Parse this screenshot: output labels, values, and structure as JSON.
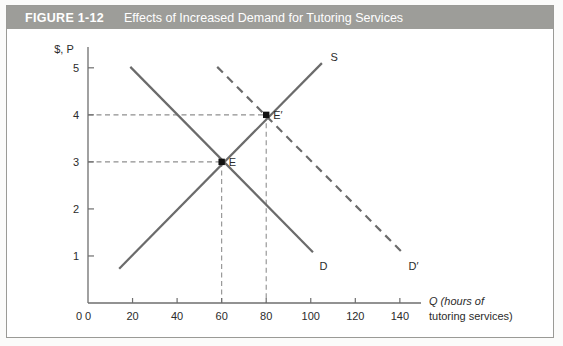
{
  "figure": {
    "number": "FIGURE 1-12",
    "title": "Effects of Increased Demand for Tutoring Services",
    "header_bg": "#9d9d99",
    "header_text_color": "#ffffff"
  },
  "colors": {
    "curve": "#6b6b6b",
    "axis": "#6e6e6e",
    "guide": "#8f8f8f",
    "point": "#111111",
    "frame": "#9a9a96",
    "background": "#ffffff"
  },
  "chart_data": {
    "type": "line",
    "title": "Effects of Increased Demand for Tutoring Services",
    "xlabel_line1": "Q (hours of",
    "xlabel_line2": "tutoring services)",
    "xlabel_italic_symbol": "Q",
    "ylabel": "$, P",
    "ylabel_italic_symbol": "P",
    "xlim": [
      0,
      145
    ],
    "ylim": [
      0,
      5.4
    ],
    "xticks": [
      0,
      20,
      40,
      60,
      80,
      100,
      120,
      140
    ],
    "xtick_labels": [
      "0",
      "20",
      "40",
      "60",
      "80",
      "100",
      "120",
      "140"
    ],
    "yticks": [
      1,
      2,
      3,
      4,
      5
    ],
    "ytick_labels": [
      "1",
      "2",
      "3",
      "4",
      "5"
    ],
    "grid": false,
    "legend": "none",
    "series": [
      {
        "name": "S",
        "label": "S",
        "style": "solid",
        "role": "supply",
        "points": [
          [
            14,
            0.73
          ],
          [
            105,
            5.1
          ]
        ],
        "label_pos": [
          108,
          5.22
        ]
      },
      {
        "name": "D",
        "label": "D",
        "style": "solid",
        "role": "demand-original",
        "points": [
          [
            19,
            5.02
          ],
          [
            101,
            1.08
          ]
        ],
        "label_pos": [
          103,
          0.79
        ]
      },
      {
        "name": "D'",
        "label": "D′",
        "style": "dashed",
        "role": "demand-increased",
        "points": [
          [
            58,
            5.02
          ],
          [
            141,
            1.08
          ]
        ],
        "label_pos": [
          143,
          0.79
        ]
      }
    ],
    "points": [
      {
        "name": "E",
        "label": "E",
        "x": 60,
        "y": 3,
        "label_offset": [
          4,
          0.06
        ],
        "guides": [
          "horizontal",
          "vertical"
        ]
      },
      {
        "name": "E'",
        "label": "E′",
        "x": 80,
        "y": 4,
        "label_offset": [
          4,
          0.06
        ],
        "guides": [
          "horizontal",
          "vertical"
        ]
      }
    ],
    "annotations": [
      {
        "text": "E",
        "x": 60,
        "y": 3,
        "note": "original equilibrium"
      },
      {
        "text": "E′",
        "x": 80,
        "y": 4,
        "note": "new equilibrium after demand increase"
      }
    ]
  }
}
